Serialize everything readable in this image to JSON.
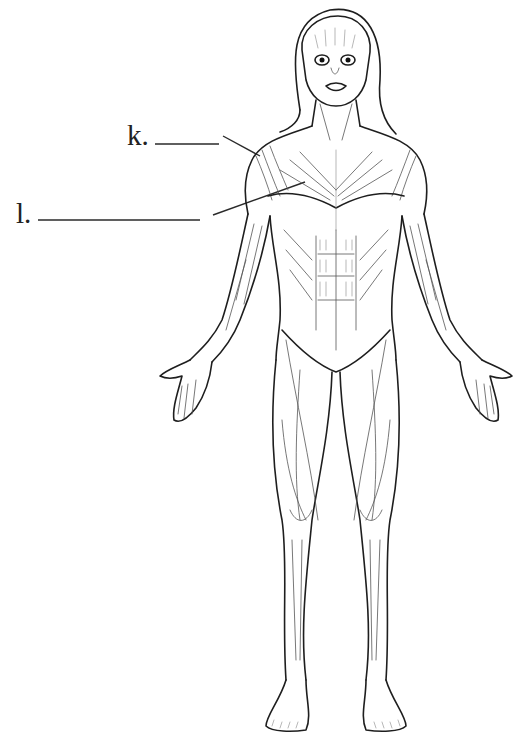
{
  "diagram": {
    "type": "anatomical-muscle-diagram",
    "labels": [
      {
        "id": "k",
        "text": "k.",
        "answer_blank": "________",
        "points_to": "deltoid (shoulder)"
      },
      {
        "id": "l",
        "text": "l.",
        "answer_blank": "________________",
        "points_to": "pectoralis major (chest)"
      }
    ],
    "colors": {
      "line_art": "#1e1e1e",
      "background": "#ffffff",
      "label_text": "#222222"
    }
  }
}
